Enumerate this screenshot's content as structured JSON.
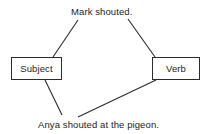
{
  "diagram": {
    "type": "sentence-parts-diagram",
    "background_color": "#ffffff",
    "stroke_color": "#2b2b2b",
    "text_color": "#242424",
    "nodes": [
      {
        "id": "subject",
        "label": "Subject"
      },
      {
        "id": "verb",
        "label": "Verb"
      }
    ],
    "examples": [
      {
        "id": "top",
        "text": "Mark shouted."
      },
      {
        "id": "bottom",
        "text": "Anya shouted at the pigeon."
      }
    ],
    "connections": [
      {
        "from": "Mark shouted.",
        "to": "Subject"
      },
      {
        "from": "Mark shouted.",
        "to": "Verb"
      },
      {
        "from": "Subject",
        "to": "Anya shouted at the pigeon."
      },
      {
        "from": "Verb",
        "to": "Anya shouted at the pigeon."
      }
    ]
  }
}
